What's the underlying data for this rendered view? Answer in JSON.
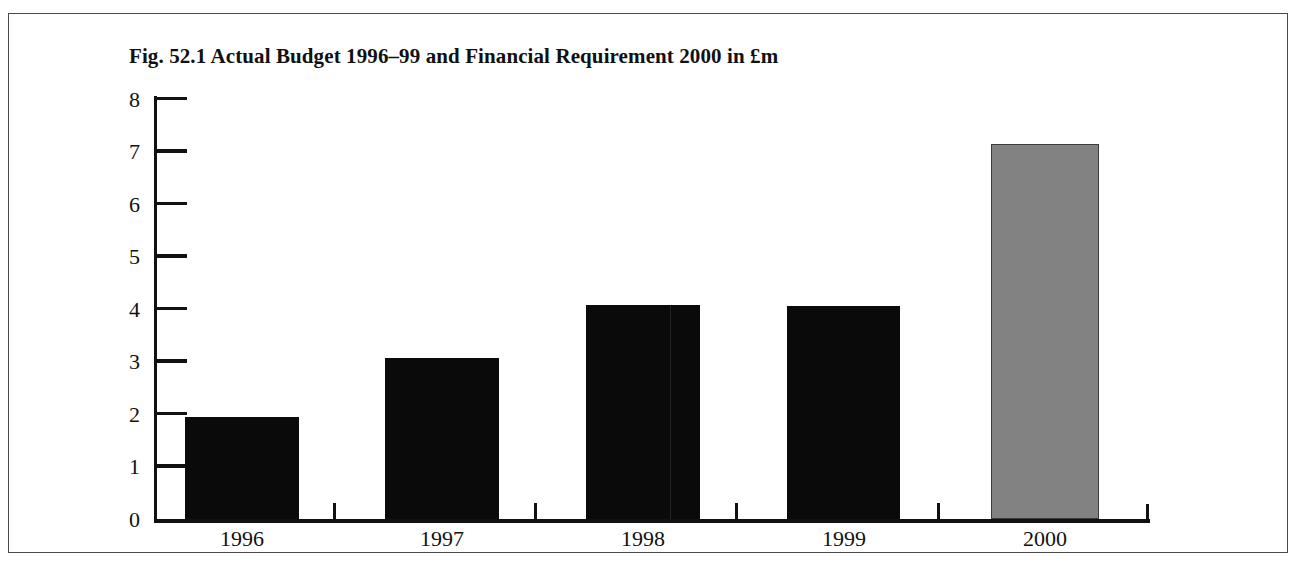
{
  "figure": {
    "title": "Fig. 52.1 Actual Budget 1996–99 and Financial Requirement 2000 in £m",
    "frame_color": "#4a4a4a",
    "background_color": "#ffffff"
  },
  "chart_data": {
    "type": "bar",
    "title": "Fig. 52.1 Actual Budget 1996–99 and Financial Requirement 2000 in £m",
    "xlabel": "",
    "ylabel": "",
    "categories": [
      "1996",
      "1997",
      "1998",
      "1999",
      "2000"
    ],
    "values": [
      1.93,
      3.05,
      4.05,
      4.03,
      7.1
    ],
    "series": [
      {
        "name": "Budget",
        "values": [
          1.93,
          3.05,
          4.05,
          4.03,
          7.1
        ],
        "colors": [
          "#0a0a0a",
          "#0a0a0a",
          "#0a0a0a",
          "#0a0a0a",
          "#828282"
        ]
      }
    ],
    "ylim": [
      0,
      8
    ],
    "ytick_labels": [
      "8",
      "7",
      "6",
      "5",
      "4",
      "3",
      "2",
      "1",
      "0"
    ],
    "ytick_values": [
      8,
      7,
      6,
      5,
      4,
      3,
      2,
      1,
      0
    ],
    "grid": false,
    "legend": "none",
    "units": "£m",
    "bar_colors": {
      "actual_budget": "#0a0a0a",
      "financial_requirement": "#828282"
    }
  },
  "axes": {
    "y_labels": [
      "8",
      "7",
      "6",
      "5",
      "4",
      "3",
      "2",
      "1",
      "0"
    ],
    "x_labels": [
      "1996",
      "1997",
      "1998",
      "1999",
      "2000"
    ]
  }
}
